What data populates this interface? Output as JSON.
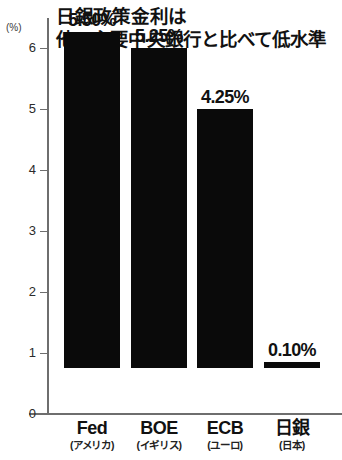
{
  "chart_data": {
    "type": "bar",
    "title": "日銀政策金利は 他の主要中央銀行と比べて低水準",
    "title_lines": [
      "日銀政策金利は",
      "他の主要中央銀行と比べて低水準"
    ],
    "categories": [
      "Fed",
      "BOE",
      "ECB",
      "日銀"
    ],
    "category_subs": [
      "(アメリカ)",
      "(イギリス)",
      "(ユーロ)",
      "(日本)"
    ],
    "values": [
      5.5,
      5.25,
      4.25,
      0.1
    ],
    "value_labels": [
      "5.50%",
      "5.25%",
      "4.25%",
      "0.10%"
    ],
    "xlabel": "",
    "ylabel": "",
    "unit_label": "(%)",
    "ylim": [
      0,
      6
    ],
    "yticks": [
      0,
      1,
      2,
      3,
      4,
      5,
      6
    ],
    "ytick_labels": [
      "0",
      "1",
      "2",
      "3",
      "4",
      "5",
      "6"
    ],
    "grid": false,
    "legend": false,
    "bar_color": "#0a0a0a",
    "background_color": "#ffffff",
    "axis_color": "#6e6e6e"
  }
}
